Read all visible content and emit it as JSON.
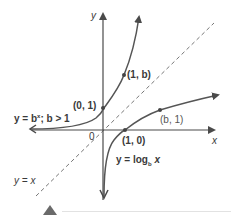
{
  "diagram": {
    "axes": {
      "x_label": "x",
      "y_label": "y",
      "origin_label": "0"
    },
    "curves": {
      "exponential": {
        "label_eq": "y = b",
        "label_exp": "x",
        "label_cond": "; b > 1"
      },
      "logarithmic": {
        "label_prefix": "y = log",
        "label_sub": "b",
        "label_var": " x"
      },
      "identity": {
        "label": "y = x"
      }
    },
    "points": {
      "p01": "(0, 1)",
      "p1b": "(1, b)",
      "p10": "(1, 0)",
      "pb1": "(b, 1)"
    },
    "colors": {
      "curve": "#555555",
      "axis": "#4a4a4a",
      "dashed": "#777777",
      "marker": "#6a6a6a"
    }
  }
}
